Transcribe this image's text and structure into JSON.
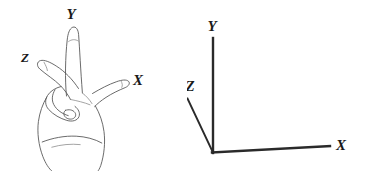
{
  "figure": {
    "background_color": "#ffffff",
    "width": 374,
    "height": 171
  },
  "hand_diagram": {
    "name": "hand-sketch",
    "description": "Line drawing of a hand with index finger up, middle finger out to upper-left, and thumb out to the right",
    "stroke_color": "#5a5a5a",
    "labels": {
      "y": "Y",
      "z": "Z",
      "x": "X"
    },
    "label_positions": {
      "y": {
        "x": 71,
        "y": 19
      },
      "z": {
        "x": 25,
        "y": 62
      },
      "x": {
        "x": 138,
        "y": 85
      }
    }
  },
  "axes_diagram": {
    "name": "coordinate-axes",
    "description": "Three-dimensional coordinate axes with Y up, X to the right, Z toward lower-left",
    "stroke_color": "#2a2a2a",
    "origin": {
      "x": 213,
      "y": 152
    },
    "labels": {
      "y": "Y",
      "z": "Z",
      "x": "X"
    },
    "label_positions": {
      "y": {
        "x": 212,
        "y": 31
      },
      "z": {
        "x": 190,
        "y": 91
      },
      "x": {
        "x": 341,
        "y": 150
      }
    },
    "axis_endpoints": {
      "y": {
        "x": 213,
        "y": 38
      },
      "x": {
        "x": 330,
        "y": 146
      },
      "z": {
        "x": 187,
        "y": 98
      }
    }
  }
}
